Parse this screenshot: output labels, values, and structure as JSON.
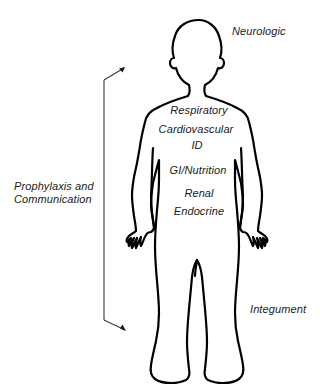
{
  "diagram": {
    "line_color": "#000000",
    "text_color": "#1a1a1a",
    "background_color": "#ffffff",
    "body_labels": [
      {
        "id": "respiratory",
        "text": "Respiratory"
      },
      {
        "id": "cardiovascular",
        "text": "Cardiovascular"
      },
      {
        "id": "id",
        "text": "ID"
      },
      {
        "id": "gi_nutrition",
        "text": "GI/Nutrition"
      },
      {
        "id": "renal",
        "text": "Renal"
      },
      {
        "id": "endocrine",
        "text": "Endocrine"
      }
    ],
    "external_labels": [
      {
        "id": "neurologic",
        "text": "Neurologic"
      },
      {
        "id": "integument",
        "text": "Integument"
      }
    ],
    "bracket_label": {
      "id": "prophylaxis_communication",
      "line1": "Prophylaxis and",
      "line2": "Communication"
    }
  }
}
